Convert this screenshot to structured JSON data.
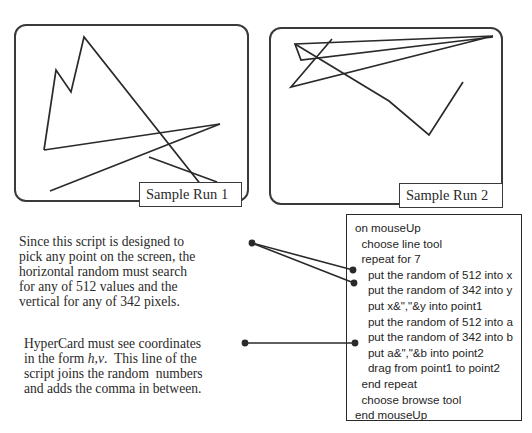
{
  "panels": [
    {
      "caption": "Sample Run 1",
      "polyline": [
        [
          28,
          124
        ],
        [
          40,
          44
        ],
        [
          55,
          66
        ],
        [
          68,
          11
        ],
        [
          201,
          179
        ]
      ],
      "segments": [
        [
          [
            28,
            124
          ],
          [
            204,
            98
          ]
        ],
        [
          [
            204,
            98
          ],
          [
            34,
            165
          ]
        ],
        [
          [
            133,
            131
          ],
          [
            201,
            156
          ]
        ]
      ]
    },
    {
      "caption": "Sample Run 2",
      "polyline": [
        [
          61,
          10
        ],
        [
          20,
          58
        ],
        [
          222,
          7
        ],
        [
          24,
          15
        ],
        [
          30,
          31
        ],
        [
          222,
          8
        ]
      ],
      "segments": [
        [
          [
            24,
            15
          ],
          [
            118,
            72
          ],
          [
            158,
            106
          ],
          [
            192,
            53
          ]
        ]
      ]
    }
  ],
  "notes": {
    "random_range": "Since this script is designed to\npick any point on the screen, the\nhorizontal random must search\nfor any of 512 values and the\nvertical for any of 342 pixels.",
    "coordinates_prefix": "HyperCard must see coordinates\nin the form ",
    "coordinates_hv": "h,v",
    "coordinates_suffix": ".  This line of the\nscript joins the random  numbers\nand adds the comma in between."
  },
  "script": {
    "lines": [
      "on mouseUp",
      "  choose line tool",
      "  repeat for 7",
      "    put the random of 512 into x",
      "    put the random of 342 into y",
      "    put x&\",\"&y into point1",
      "    put the random of 512 into a",
      "    put the random of 342 into b",
      "    put a&\",\"&b into point2",
      "    drag from point1 to point2",
      "  end repeat",
      "  choose browse tool",
      "end mouseUp"
    ]
  },
  "colors": {
    "ink": "#2a2a2a",
    "background": "#ffffff"
  }
}
